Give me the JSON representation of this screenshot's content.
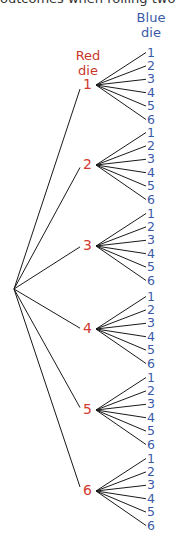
{
  "caption": "outcomes when rolling two dice",
  "headers": {
    "red": [
      "Red",
      "die"
    ],
    "blue": [
      "Blue",
      "die"
    ]
  },
  "colors": {
    "red": "#d13a2f",
    "blue": "#3a5aa8",
    "lines": "#1a1a1a"
  },
  "tree": {
    "root": {
      "x": 14,
      "y": 289
    },
    "red_die": [
      {
        "label": "1",
        "y": 85
      },
      {
        "label": "2",
        "y": 165
      },
      {
        "label": "3",
        "y": 246
      },
      {
        "label": "4",
        "y": 329
      },
      {
        "label": "5",
        "y": 410
      },
      {
        "label": "6",
        "y": 491
      }
    ],
    "blue_die_labels": [
      "1",
      "2",
      "3",
      "4",
      "5",
      "6"
    ],
    "blue_spacing": 13.4
  }
}
